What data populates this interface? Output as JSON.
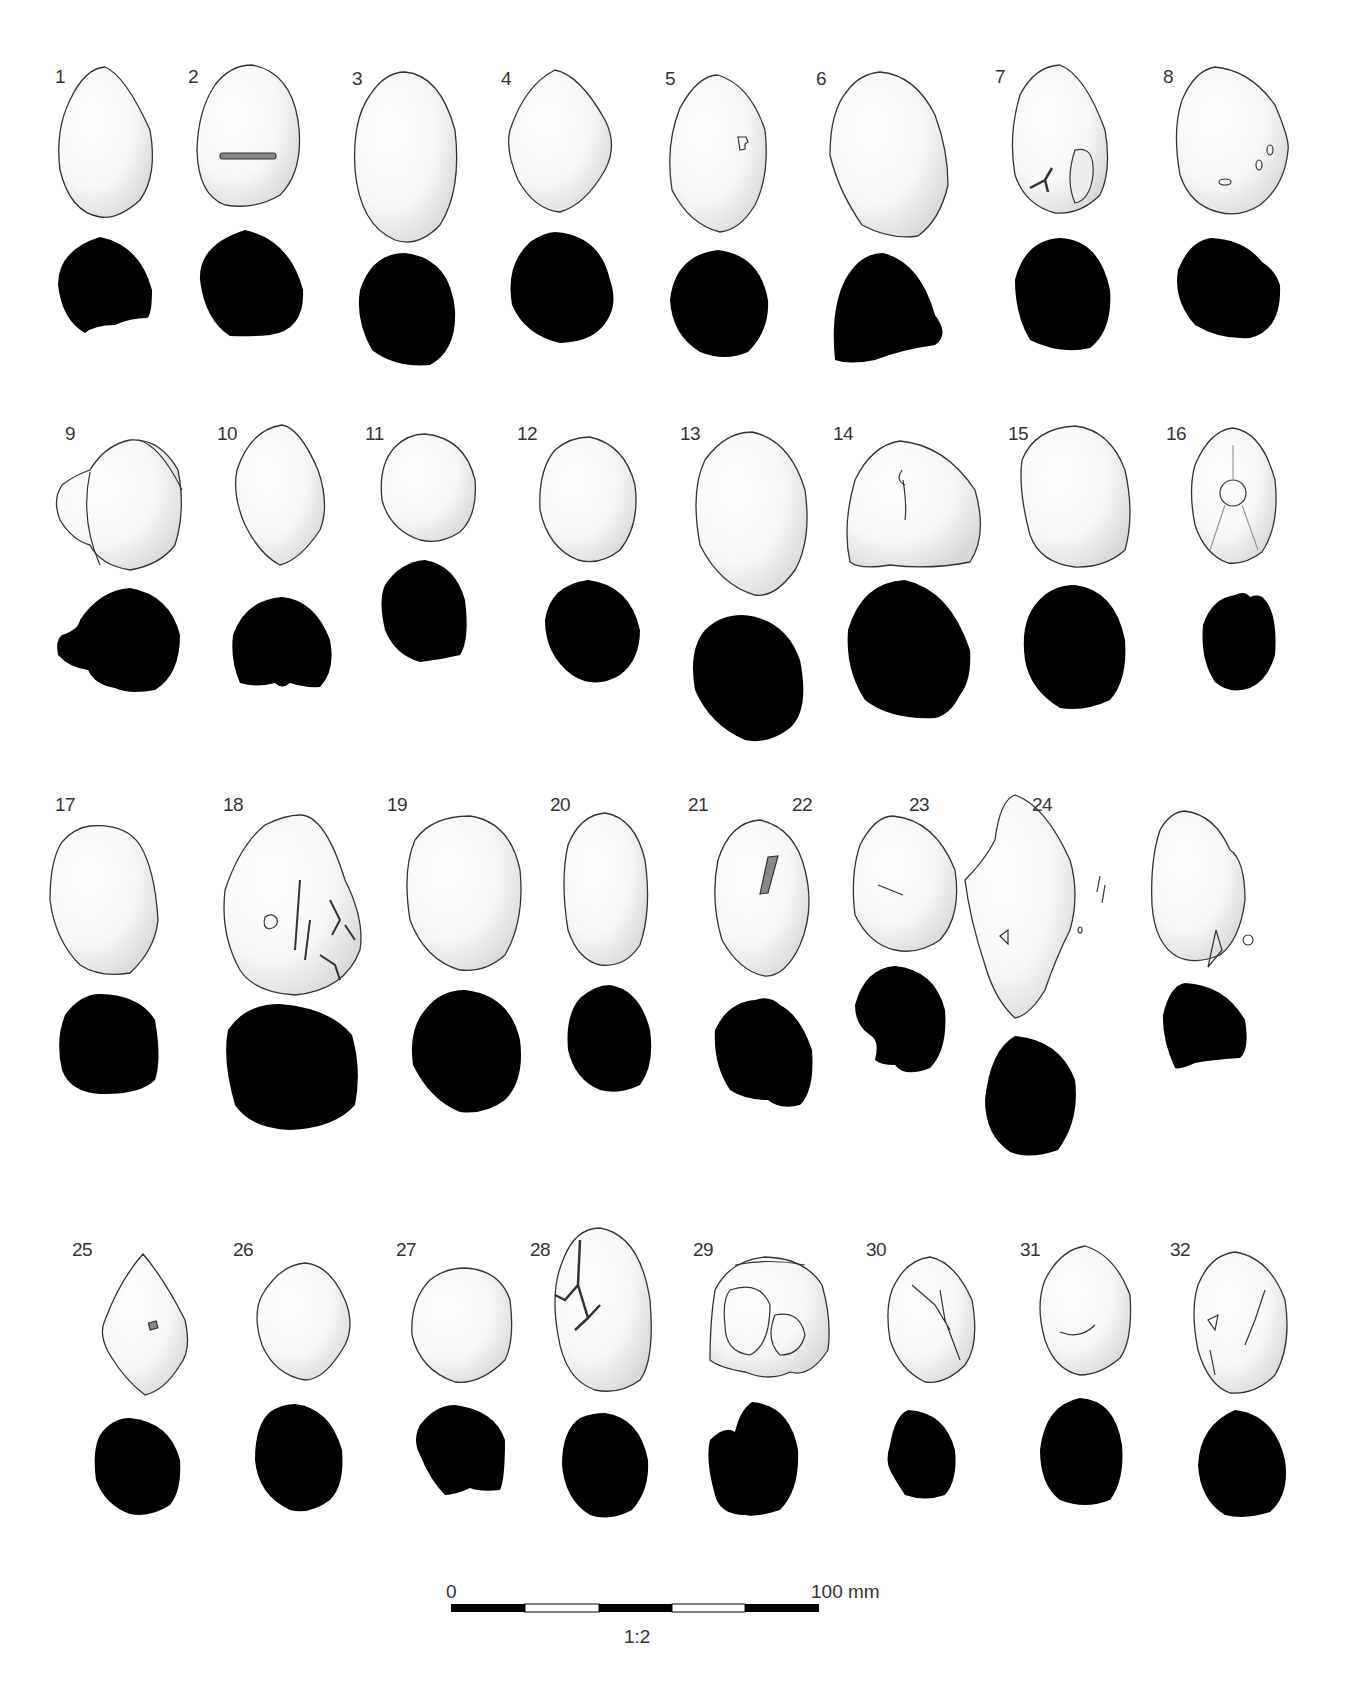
{
  "figure": {
    "type": "archaeological drawing plate",
    "items": [
      {
        "number": "1",
        "label_pos": [
          55,
          77
        ]
      },
      {
        "number": "2",
        "label_pos": [
          188,
          77
        ]
      },
      {
        "number": "3",
        "label_pos": [
          352,
          79
        ]
      },
      {
        "number": "4",
        "label_pos": [
          501,
          79
        ]
      },
      {
        "number": "5",
        "label_pos": [
          665,
          79
        ]
      },
      {
        "number": "6",
        "label_pos": [
          816,
          79
        ]
      },
      {
        "number": "7",
        "label_pos": [
          995,
          77
        ]
      },
      {
        "number": "8",
        "label_pos": [
          1163,
          77
        ]
      },
      {
        "number": "9",
        "label_pos": [
          65,
          434
        ]
      },
      {
        "number": "10",
        "label_pos": [
          217,
          434
        ]
      },
      {
        "number": "11",
        "label_pos": [
          365,
          434
        ]
      },
      {
        "number": "12",
        "label_pos": [
          517,
          434
        ]
      },
      {
        "number": "13",
        "label_pos": [
          680,
          434
        ]
      },
      {
        "number": "14",
        "label_pos": [
          833,
          434
        ]
      },
      {
        "number": "15",
        "label_pos": [
          1008,
          434
        ]
      },
      {
        "number": "16",
        "label_pos": [
          1166,
          434
        ]
      },
      {
        "number": "17",
        "label_pos": [
          55,
          805
        ]
      },
      {
        "number": "18",
        "label_pos": [
          223,
          805
        ]
      },
      {
        "number": "19",
        "label_pos": [
          387,
          805
        ]
      },
      {
        "number": "20",
        "label_pos": [
          550,
          805
        ]
      },
      {
        "number": "21",
        "label_pos": [
          688,
          805
        ]
      },
      {
        "number": "22",
        "label_pos": [
          792,
          805
        ]
      },
      {
        "number": "23",
        "label_pos": [
          909,
          805
        ]
      },
      {
        "number": "24",
        "label_pos": [
          1032,
          805
        ]
      },
      {
        "number": "25",
        "label_pos": [
          72,
          1250
        ]
      },
      {
        "number": "26",
        "label_pos": [
          233,
          1250
        ]
      },
      {
        "number": "27",
        "label_pos": [
          396,
          1250
        ]
      },
      {
        "number": "28",
        "label_pos": [
          530,
          1250
        ]
      },
      {
        "number": "29",
        "label_pos": [
          693,
          1250
        ]
      },
      {
        "number": "30",
        "label_pos": [
          866,
          1250
        ]
      },
      {
        "number": "31",
        "label_pos": [
          1020,
          1250
        ]
      },
      {
        "number": "32",
        "label_pos": [
          1170,
          1250
        ]
      }
    ]
  },
  "scale_bar": {
    "start_label": "0",
    "end_label": "100 mm",
    "ratio_label": "1:2",
    "segments": 5
  },
  "colors": {
    "background": "#ffffff",
    "outline": "#333333",
    "section_fill": "#000000",
    "stipple": "#d9d9d9"
  }
}
